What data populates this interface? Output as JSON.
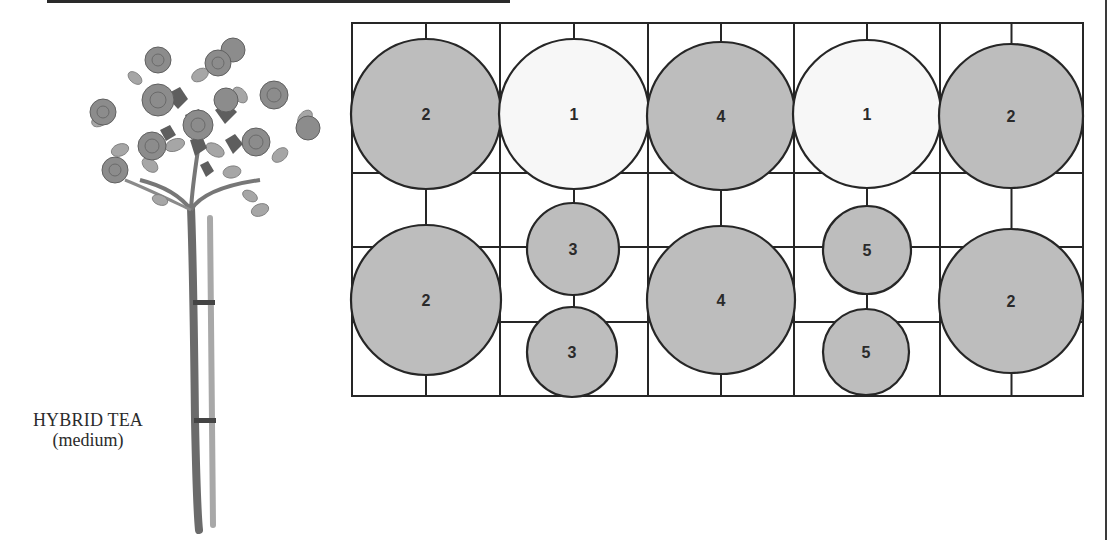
{
  "caption": {
    "title": "HYBRID TEA",
    "subtitle": "(medium)"
  },
  "illustration": {
    "subject": "standard tree rose on stake",
    "icon": "rose-tree-icon"
  },
  "plan": {
    "description": "Bed planting plan: 5 columns x 2 rows grid with numbered plant circles",
    "colors": {
      "line": "#262626",
      "shaded_fill": "#bdbdbd",
      "white_fill": "#f7f7f7",
      "number": "#2a2a2a"
    },
    "grid": {
      "x": [
        352,
        500,
        648,
        794,
        940,
        1083
      ],
      "y_top": 23,
      "y_mid_lines": [
        173,
        247,
        322
      ],
      "y_bottom": 396
    },
    "plants": [
      {
        "id": "p1",
        "label": "2",
        "cx": 426,
        "cy": 114,
        "r": 75,
        "fill": "shaded"
      },
      {
        "id": "p2",
        "label": "1",
        "cx": 574,
        "cy": 114,
        "r": 75,
        "fill": "white"
      },
      {
        "id": "p3",
        "label": "4",
        "cx": 721,
        "cy": 116,
        "r": 74,
        "fill": "shaded"
      },
      {
        "id": "p4",
        "label": "1",
        "cx": 867,
        "cy": 114,
        "r": 74,
        "fill": "white"
      },
      {
        "id": "p5",
        "label": "2",
        "cx": 1011,
        "cy": 116,
        "r": 72,
        "fill": "shaded"
      },
      {
        "id": "p6",
        "label": "2",
        "cx": 426,
        "cy": 300,
        "r": 75,
        "fill": "shaded"
      },
      {
        "id": "p7",
        "label": "3",
        "cx": 573,
        "cy": 249,
        "r": 46,
        "fill": "shaded"
      },
      {
        "id": "p8",
        "label": "3",
        "cx": 572,
        "cy": 352,
        "r": 45,
        "fill": "shaded"
      },
      {
        "id": "p9",
        "label": "4",
        "cx": 721,
        "cy": 300,
        "r": 74,
        "fill": "shaded"
      },
      {
        "id": "p10",
        "label": "5",
        "cx": 867,
        "cy": 250,
        "r": 44,
        "fill": "shaded"
      },
      {
        "id": "p11",
        "label": "5",
        "cx": 866,
        "cy": 352,
        "r": 43,
        "fill": "shaded"
      },
      {
        "id": "p12",
        "label": "2",
        "cx": 1011,
        "cy": 301,
        "r": 72,
        "fill": "shaded"
      }
    ]
  }
}
